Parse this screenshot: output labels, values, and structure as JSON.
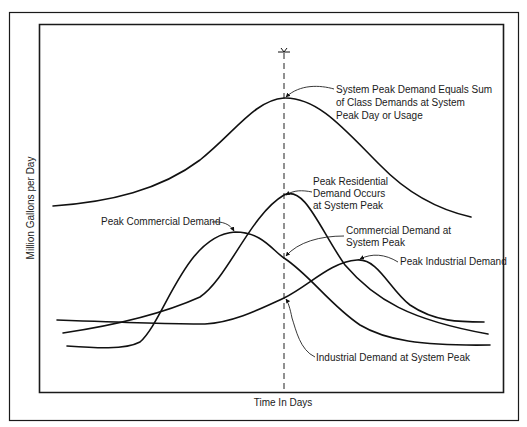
{
  "diagram": {
    "axes": {
      "xlabel": "Time In Days",
      "ylabel": "Million Gallons per Day"
    },
    "curves": [
      {
        "name": "system-demand",
        "label": "System Peak Demand Equals Sum of Class Demands at System Peak Day or Usage"
      },
      {
        "name": "residential-demand",
        "label": "Peak Residential Demand Occurs at System Peak"
      },
      {
        "name": "commercial-demand",
        "label": "Peak Commercial Demand"
      },
      {
        "name": "industrial-demand",
        "label": "Peak Industrial Demand"
      }
    ],
    "annotations": {
      "system_peak": [
        "System Peak Demand Equals Sum",
        "of Class Demands at System",
        "Peak Day or Usage"
      ],
      "residential_peak": [
        "Peak Residential",
        "Demand Occurs",
        "at System Peak"
      ],
      "commercial_peak": "Peak Commercial Demand",
      "commercial_at_system_peak": [
        "Commercial Demand at",
        "System Peak"
      ],
      "industrial_peak": "Peak Industrial Demand",
      "industrial_at_system_peak": "Industrial Demand at System Peak"
    },
    "colors": {
      "line": "#111111",
      "background": "#ffffff"
    }
  }
}
